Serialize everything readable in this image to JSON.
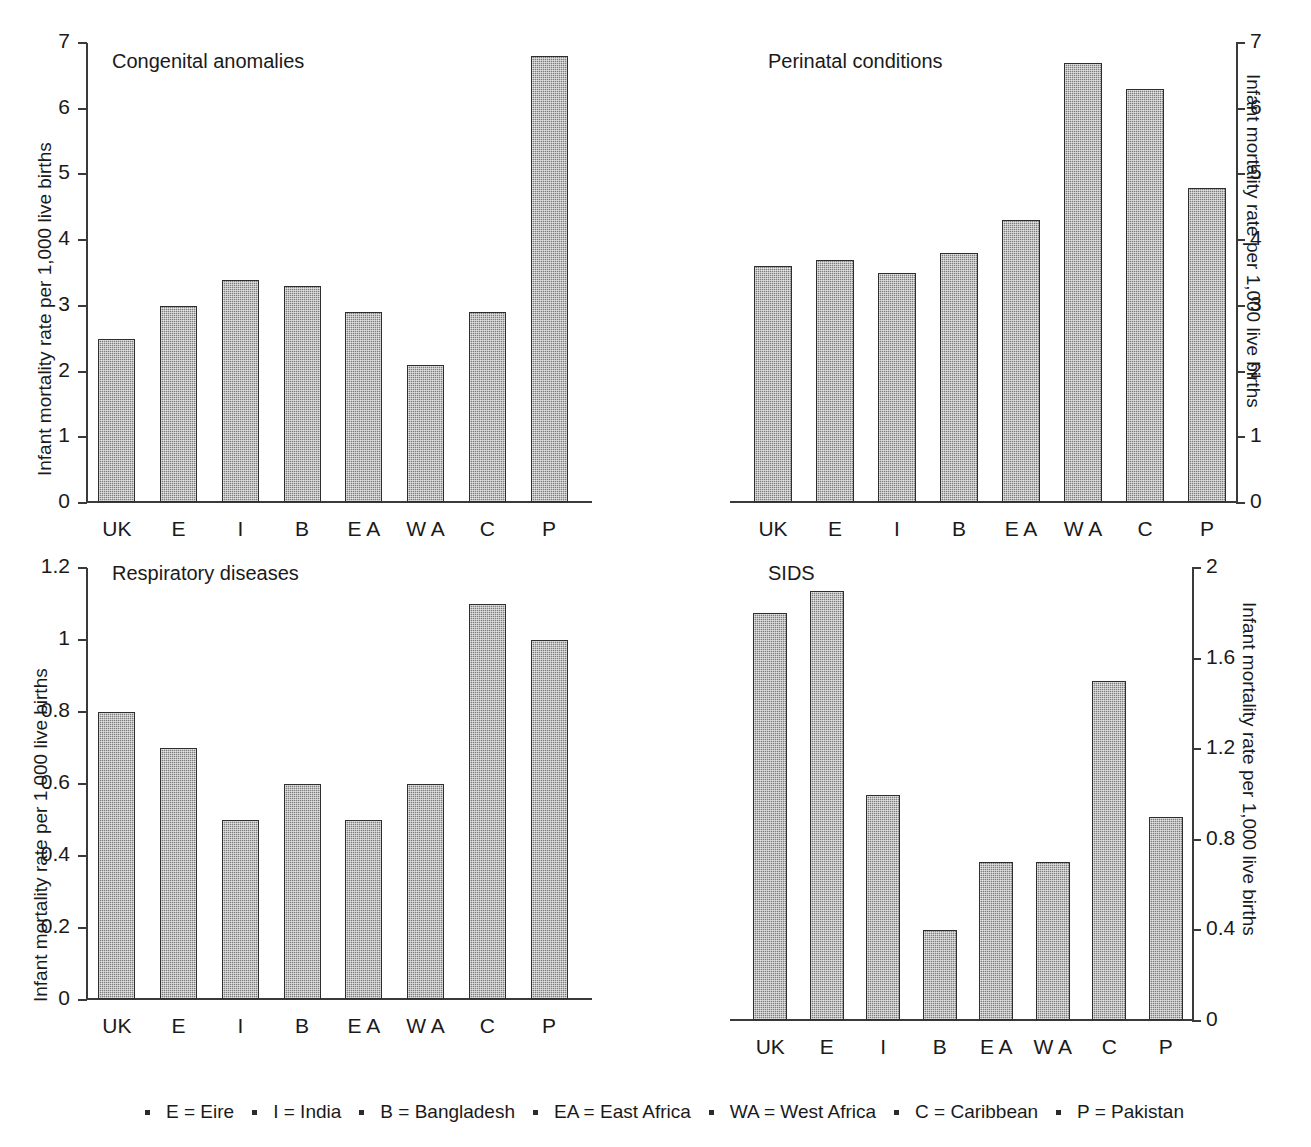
{
  "axis_title": "Infant mortality rate per 1,000 live births",
  "categories": [
    "UK",
    "E",
    "I",
    "B",
    "E A",
    "W A",
    "C",
    "P"
  ],
  "panels": {
    "congenital": {
      "title": "Congenital anomalies",
      "ticks": [
        "0",
        "1",
        "2",
        "3",
        "4",
        "5",
        "6",
        "7"
      ],
      "axis_side": "left"
    },
    "perinatal": {
      "title": "Perinatal conditions",
      "ticks": [
        "0",
        "1",
        "2",
        "3",
        "4",
        "5",
        "6",
        "7"
      ],
      "axis_side": "right"
    },
    "respiratory": {
      "title": "Respiratory diseases",
      "ticks": [
        "0",
        "0.2",
        "0.4",
        "0.6",
        "0.8",
        "1",
        "1.2"
      ],
      "axis_side": "left"
    },
    "sids": {
      "title": "SIDS",
      "ticks": [
        "0",
        "0.4",
        "0.8",
        "1.2",
        "1.6",
        "2"
      ],
      "axis_side": "right"
    }
  },
  "legend": [
    "E = Eire",
    "I = India",
    "B = Bangladesh",
    "EA = East Africa",
    "WA = West Africa",
    "C = Caribbean",
    "P = Pakistan"
  ],
  "colors": {
    "bar_fill": "#7e7e7e",
    "bar_border": "#2e2e2e",
    "axis": "#3a3a3a",
    "text": "#1a1a1a",
    "background": "#ffffff"
  },
  "chart_data": [
    {
      "type": "bar",
      "id": "congenital",
      "title": "Congenital anomalies",
      "xlabel": "",
      "ylabel": "Infant mortality rate per 1,000 live births",
      "categories": [
        "UK",
        "E",
        "I",
        "B",
        "E A",
        "W A",
        "C",
        "P"
      ],
      "values": [
        2.5,
        3.0,
        3.4,
        3.3,
        2.9,
        2.1,
        2.9,
        6.8
      ],
      "ylim": [
        0,
        7
      ],
      "yticks": [
        0,
        1,
        2,
        3,
        4,
        5,
        6,
        7
      ],
      "axis_position": "left",
      "grid": false,
      "legend": "none"
    },
    {
      "type": "bar",
      "id": "perinatal",
      "title": "Perinatal conditions",
      "xlabel": "",
      "ylabel": "Infant mortality rate per 1,000 live births",
      "categories": [
        "UK",
        "E",
        "I",
        "B",
        "E A",
        "W A",
        "C",
        "P"
      ],
      "values": [
        3.6,
        3.7,
        3.5,
        3.8,
        4.3,
        6.7,
        6.3,
        4.8
      ],
      "ylim": [
        0,
        7
      ],
      "yticks": [
        0,
        1,
        2,
        3,
        4,
        5,
        6,
        7
      ],
      "axis_position": "right",
      "grid": false,
      "legend": "none"
    },
    {
      "type": "bar",
      "id": "respiratory",
      "title": "Respiratory diseases",
      "xlabel": "",
      "ylabel": "Infant mortality rate per 1,000 live births",
      "categories": [
        "UK",
        "E",
        "I",
        "B",
        "E A",
        "W A",
        "C",
        "P"
      ],
      "values": [
        0.8,
        0.7,
        0.5,
        0.6,
        0.5,
        0.6,
        1.1,
        1.0
      ],
      "ylim": [
        0,
        1.2
      ],
      "yticks": [
        0,
        0.2,
        0.4,
        0.6,
        0.8,
        1.0,
        1.2
      ],
      "axis_position": "left",
      "grid": false,
      "legend": "none"
    },
    {
      "type": "bar",
      "id": "sids",
      "title": "SIDS",
      "xlabel": "",
      "ylabel": "Infant mortality rate per 1,000 live births",
      "categories": [
        "UK",
        "E",
        "I",
        "B",
        "E A",
        "W A",
        "C",
        "P"
      ],
      "values": [
        1.8,
        1.9,
        1.0,
        0.4,
        0.7,
        0.7,
        1.5,
        0.9
      ],
      "ylim": [
        0,
        2
      ],
      "yticks": [
        0,
        0.4,
        0.8,
        1.2,
        1.6,
        2.0
      ],
      "axis_position": "right",
      "grid": false,
      "legend": "none"
    }
  ]
}
